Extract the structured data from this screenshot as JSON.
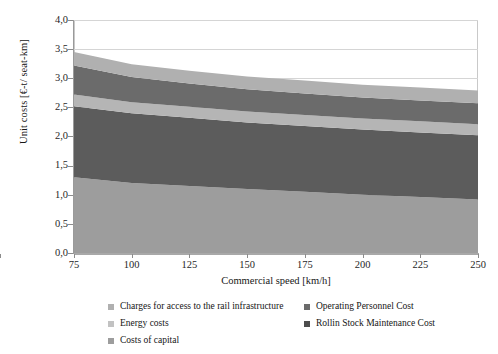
{
  "chart_data": {
    "type": "area",
    "title": "",
    "subtitle": "",
    "xlabel": "Commercial speed [km/h]",
    "ylabel": "Unit costs [€-t/ seat-km]",
    "xlim": [
      75,
      250
    ],
    "ylim": [
      0.0,
      4.0
    ],
    "xticks": [
      75,
      100,
      125,
      150,
      175,
      200,
      225,
      250
    ],
    "xtick_labels": [
      "75",
      "100",
      "125",
      "150",
      "175",
      "200",
      "225",
      "250"
    ],
    "yticks": [
      0.0,
      0.5,
      1.0,
      1.5,
      2.0,
      2.5,
      3.0,
      3.5,
      4.0
    ],
    "ytick_labels": [
      "0,0",
      "0,5",
      "1,0",
      "1,5",
      "2,0",
      "2,5",
      "3,0",
      "3,5",
      "4,0"
    ],
    "grid": true,
    "grid_axis": "y",
    "legend_position": "bottom",
    "stacked": true,
    "x": [
      75,
      100,
      125,
      150,
      175,
      200,
      225,
      250
    ],
    "series": [
      {
        "name": "Costs of capital",
        "color": "#9d9d9d",
        "values": [
          1.3,
          1.2,
          1.15,
          1.1,
          1.05,
          1.0,
          0.96,
          0.92
        ]
      },
      {
        "name": "Rollin Stock Maintenance Cost",
        "color": "#5c5c5c",
        "values": [
          1.22,
          1.2,
          1.17,
          1.14,
          1.13,
          1.12,
          1.11,
          1.1
        ]
      },
      {
        "name": "Energy costs",
        "color": "#b5b5b5",
        "values": [
          0.2,
          0.19,
          0.19,
          0.19,
          0.19,
          0.19,
          0.19,
          0.19
        ]
      },
      {
        "name": "Operating Personnel Cost",
        "color": "#6b6b6b",
        "values": [
          0.5,
          0.43,
          0.4,
          0.38,
          0.37,
          0.36,
          0.36,
          0.36
        ]
      },
      {
        "name": "Charges for access to the rail infrastructure",
        "color": "#b0b0b0",
        "values": [
          0.23,
          0.22,
          0.22,
          0.22,
          0.22,
          0.22,
          0.22,
          0.22
        ]
      }
    ],
    "cumulative_top": [
      3.45,
      3.24,
      3.13,
      3.03,
      2.96,
      2.89,
      2.84,
      2.79
    ],
    "axis_color": "#9a9a9a",
    "grid_color": "#d5d5d5",
    "background": "#ffffff"
  },
  "legend": {
    "columns": [
      {
        "items": [
          {
            "label": "Charges for access to the rail infrastructure",
            "color": "#b0b0b0",
            "marker": "square-marker"
          },
          {
            "label": "Energy costs",
            "color": "#b5b5b5",
            "marker": "square-marker"
          },
          {
            "label": "Costs of capital",
            "color": "#9d9d9d",
            "marker": "square-marker"
          }
        ]
      },
      {
        "items": [
          {
            "label": "Operating Personnel Cost",
            "color": "#6b6b6b",
            "marker": "square-marker"
          },
          {
            "label": "Rollin Stock Maintenance Cost",
            "color": "#4d4d4d",
            "marker": "square-marker"
          }
        ]
      }
    ]
  }
}
